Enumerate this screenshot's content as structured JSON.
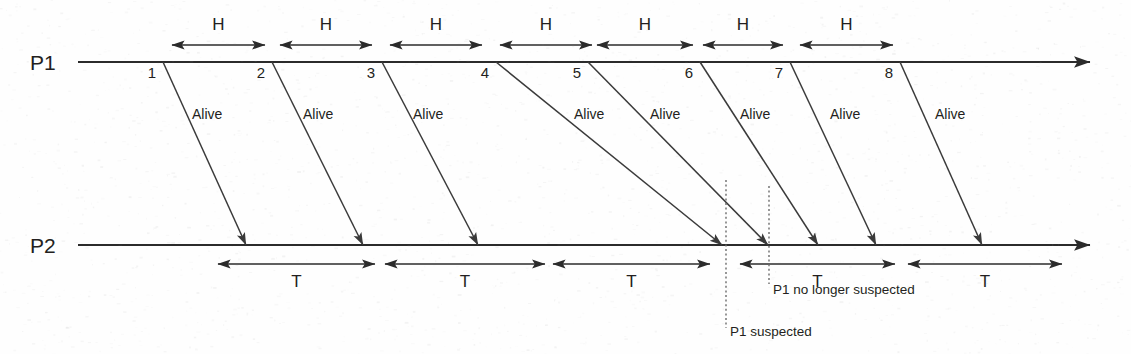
{
  "figure": {
    "background_color": "#fefefe",
    "line_color": "#2b2b2b"
  },
  "lifelines": [
    {
      "id": "p1",
      "label": "P1",
      "y": 62,
      "x_start": 78,
      "x_end": 1090
    },
    {
      "id": "p2",
      "label": "P2",
      "y": 245,
      "x_start": 78,
      "x_end": 1090
    }
  ],
  "send_events": [
    {
      "num": "1",
      "x": 163
    },
    {
      "num": "2",
      "x": 272
    },
    {
      "num": "3",
      "x": 382
    },
    {
      "num": "4",
      "x": 496
    },
    {
      "num": "5",
      "x": 588
    },
    {
      "num": "6",
      "x": 700
    },
    {
      "num": "7",
      "x": 790
    },
    {
      "num": "8",
      "x": 900
    }
  ],
  "messages": [
    {
      "num": "1",
      "label": "Alive",
      "x1": 163,
      "y1": 62,
      "x2": 246,
      "y2": 245,
      "label_x": 192,
      "label_y": 119
    },
    {
      "num": "2",
      "label": "Alive",
      "x1": 272,
      "y1": 62,
      "x2": 363,
      "y2": 245,
      "label_x": 303,
      "label_y": 119
    },
    {
      "num": "3",
      "label": "Alive",
      "x1": 382,
      "y1": 62,
      "x2": 478,
      "y2": 245,
      "label_x": 413,
      "label_y": 119
    },
    {
      "num": "4",
      "label": "Alive",
      "x1": 496,
      "y1": 62,
      "x2": 722,
      "y2": 245,
      "label_x": 574,
      "label_y": 119
    },
    {
      "num": "5",
      "label": "Alive",
      "x1": 588,
      "y1": 62,
      "x2": 768,
      "y2": 245,
      "label_x": 650,
      "label_y": 119
    },
    {
      "num": "6",
      "label": "Alive",
      "x1": 700,
      "y1": 62,
      "x2": 818,
      "y2": 245,
      "label_x": 740,
      "label_y": 119
    },
    {
      "num": "7",
      "label": "Alive",
      "x1": 790,
      "y1": 62,
      "x2": 876,
      "y2": 245,
      "label_x": 830,
      "label_y": 119
    },
    {
      "num": "8",
      "label": "Alive",
      "x1": 900,
      "y1": 62,
      "x2": 982,
      "y2": 245,
      "label_x": 935,
      "label_y": 119
    }
  ],
  "h_intervals": {
    "label": "H",
    "y_line": 45,
    "y_text": 30,
    "spans": [
      {
        "x1": 172,
        "x2": 265
      },
      {
        "x1": 280,
        "x2": 372
      },
      {
        "x1": 390,
        "x2": 482
      },
      {
        "x1": 500,
        "x2": 592
      },
      {
        "x1": 597,
        "x2": 693
      },
      {
        "x1": 703,
        "x2": 783
      },
      {
        "x1": 800,
        "x2": 893
      }
    ]
  },
  "t_intervals": {
    "label": "T",
    "y_line": 264,
    "y_text": 287,
    "spans": [
      {
        "x1": 218,
        "x2": 375
      },
      {
        "x1": 385,
        "x2": 545
      },
      {
        "x1": 553,
        "x2": 710
      },
      {
        "x1": 740,
        "x2": 895
      },
      {
        "x1": 908,
        "x2": 1062
      }
    ]
  },
  "annotations": [
    {
      "id": "p1-suspected",
      "text": "P1 suspected",
      "x_line": 726,
      "y_top": 180,
      "y_bottom": 328,
      "text_x": 730,
      "text_y": 336
    },
    {
      "id": "p1-no-longer-suspected",
      "text": "P1 no longer suspected",
      "x_line": 769,
      "y_top": 186,
      "y_bottom": 284,
      "text_x": 773,
      "text_y": 294
    }
  ]
}
